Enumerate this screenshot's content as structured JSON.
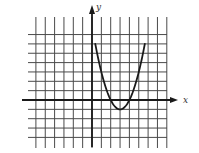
{
  "chart_data": {
    "type": "line",
    "title": "",
    "xlabel": "x",
    "ylabel": "y",
    "grid": true,
    "legend": null,
    "xlim": [
      -6,
      8
    ],
    "ylim": [
      -4,
      8
    ],
    "tick_labels": false,
    "series": [
      {
        "name": "parabola",
        "description": "Upward-opening parabola with vertex near (3, -1), x-intercepts near 2 and 4, plotted from x≈0.35 to x≈5.65",
        "x": [
          0.35,
          1,
          1.5,
          2,
          2.5,
          3,
          3.5,
          4,
          4.5,
          5,
          5.65
        ],
        "y": [
          6.0,
          3.0,
          1.25,
          0,
          -0.75,
          -1,
          -0.75,
          0,
          1.25,
          3.0,
          6.0
        ]
      }
    ]
  },
  "labels": {
    "x_axis": "x",
    "y_axis": "y"
  },
  "colors": {
    "grid": "#4a4a4a",
    "axis": "#1a1a1a",
    "curve": "#1a1a1a",
    "background": "#ffffff"
  }
}
